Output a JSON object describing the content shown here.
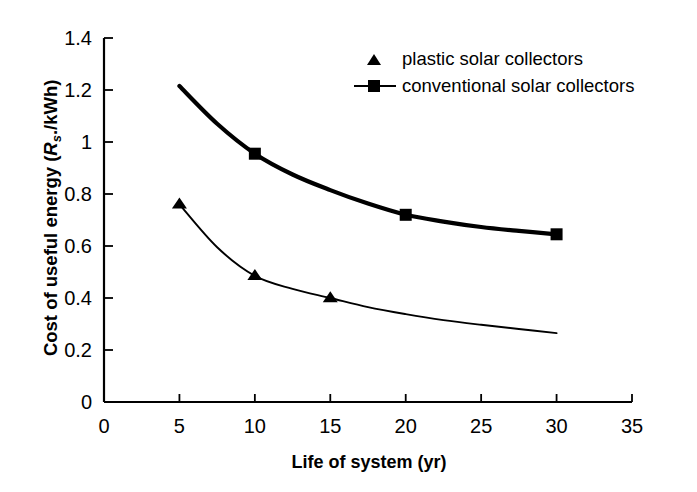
{
  "figure": {
    "background_color": "#ffffff",
    "ink_color": "#000000"
  },
  "axes": {
    "x_title": "Life of system (yr)",
    "y_title_prefix": "Cost of useful energy (",
    "y_title_symbol": "R",
    "y_title_subscript": "s",
    "y_title_suffix": "./kWh)",
    "x_ticks": [
      "0",
      "5",
      "10",
      "15",
      "20",
      "25",
      "30",
      "35"
    ],
    "y_ticks": [
      "0",
      "0.2",
      "0.4",
      "0.6",
      "0.8",
      "1",
      "1.2",
      "1.4"
    ]
  },
  "legend": {
    "position": "inside-upper-right",
    "entries": [
      {
        "label": "plastic solar collectors",
        "marker": "triangle-icon",
        "has_line": false
      },
      {
        "label": "conventional solar collectors",
        "marker": "square-icon",
        "has_line": true
      }
    ]
  },
  "chart_data": {
    "type": "line",
    "title": "",
    "subtitle": "",
    "xlabel": "Life of system (yr)",
    "ylabel": "Cost of useful energy (Rs./kWh)",
    "xlim": [
      0,
      35
    ],
    "ylim": [
      0,
      1.4
    ],
    "xticks": [
      0,
      5,
      10,
      15,
      20,
      25,
      30,
      35
    ],
    "yticks": [
      0,
      0.2,
      0.4,
      0.6,
      0.8,
      1,
      1.2,
      1.4
    ],
    "grid": false,
    "legend_position": "upper right (inside plot)",
    "series": [
      {
        "name": "plastic solar collectors",
        "marker": "triangle",
        "line_width": "thin",
        "markers": {
          "x": [
            5,
            10,
            15
          ],
          "y": [
            0.76,
            0.485,
            0.4
          ]
        },
        "curve": {
          "x": [
            5,
            7.5,
            10,
            12.5,
            15,
            17.5,
            20,
            22.5,
            25,
            27.5,
            30
          ],
          "y": [
            0.76,
            0.595,
            0.485,
            0.435,
            0.4,
            0.365,
            0.338,
            0.315,
            0.297,
            0.281,
            0.265
          ]
        }
      },
      {
        "name": "conventional solar collectors",
        "marker": "square",
        "line_width": "thick",
        "markers": {
          "x": [
            10,
            20,
            30
          ],
          "y": [
            0.955,
            0.72,
            0.645
          ]
        },
        "curve": {
          "x": [
            5,
            7.5,
            10,
            12.5,
            15,
            17.5,
            20,
            22.5,
            25,
            27.5,
            30
          ],
          "y": [
            1.215,
            1.07,
            0.955,
            0.875,
            0.815,
            0.763,
            0.72,
            0.694,
            0.673,
            0.658,
            0.645
          ]
        }
      }
    ]
  }
}
